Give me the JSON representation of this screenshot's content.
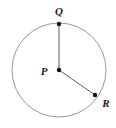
{
  "figure": {
    "background_color": "#ffffff",
    "width": 116,
    "height": 128
  },
  "style": {
    "circle_stroke": "#8c8c8c",
    "circle_stroke_width": 0.9,
    "radius_stroke": "#4a4a4a",
    "radius_stroke_width": 0.9,
    "point_fill": "#111111",
    "point_radius": 2.2,
    "label_color": "#1a1a1a",
    "label_font_size": 11
  },
  "circle": {
    "name": "circle-p",
    "center_x": 59,
    "center_y": 70,
    "radius": 47
  },
  "points": [
    {
      "id": "P",
      "label": "P",
      "role": "center",
      "x": 59,
      "y": 70,
      "label_x": 44,
      "label_y": 75,
      "label_anchor": "middle"
    },
    {
      "id": "Q",
      "label": "Q",
      "role": "on-circle",
      "x": 59,
      "y": 24,
      "label_x": 59,
      "label_y": 15,
      "label_anchor": "middle"
    },
    {
      "id": "R",
      "label": "R",
      "role": "on-circle",
      "x": 95,
      "y": 95,
      "label_x": 106,
      "label_y": 107,
      "label_anchor": "middle"
    }
  ],
  "segments": [
    {
      "id": "PQ",
      "name": "radius-pq",
      "from": "P",
      "to": "Q",
      "x1": 59,
      "y1": 70,
      "x2": 59,
      "y2": 24
    },
    {
      "id": "PR",
      "name": "radius-pr",
      "from": "P",
      "to": "R",
      "x1": 59,
      "y1": 70,
      "x2": 95,
      "y2": 95
    }
  ]
}
